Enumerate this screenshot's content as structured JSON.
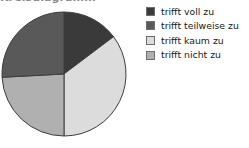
{
  "title": {
    "text": "Kreisdiagramm",
    "clipped": true
  },
  "legend": {
    "position": "right",
    "items": [
      {
        "label": "trifft voll zu",
        "color": "#3a3a3a",
        "swatch_name": "legend-swatch-trifft-voll-zu"
      },
      {
        "label": "trifft teilweise zu",
        "color": "#595959",
        "swatch_name": "legend-swatch-trifft-teilweise-zu"
      },
      {
        "label": "trifft kaum zu",
        "color": "#dcdcdc",
        "swatch_name": "legend-swatch-trifft-kaum-zu"
      },
      {
        "label": "trifft nicht zu",
        "color": "#b0b0b0",
        "swatch_name": "legend-swatch-trifft-nicht-zu"
      }
    ]
  },
  "chart_data": {
    "type": "pie",
    "title": "Kreisdiagramm",
    "xlabel": "",
    "ylabel": "",
    "legend_position": "right",
    "grid": false,
    "start_angle_deg": 0,
    "direction": "clockwise",
    "categories": [
      "trifft voll zu",
      "trifft teilweise zu",
      "trifft kaum zu",
      "trifft nicht zu"
    ],
    "values": [
      15,
      26,
      35,
      24
    ],
    "unit": "%",
    "colors": [
      "#3a3a3a",
      "#595959",
      "#dcdcdc",
      "#b0b0b0"
    ],
    "slices": [
      {
        "label": "trifft voll zu",
        "value": 15,
        "color": "#3a3a3a",
        "start_deg": 0,
        "end_deg": 53
      },
      {
        "label": "trifft kaum zu",
        "value": 35,
        "color": "#dcdcdc",
        "start_deg": 53,
        "end_deg": 180
      },
      {
        "label": "trifft nicht zu",
        "value": 24,
        "color": "#b0b0b0",
        "start_deg": 180,
        "end_deg": 267
      },
      {
        "label": "trifft teilweise zu",
        "value": 26,
        "color": "#595959",
        "start_deg": 267,
        "end_deg": 360
      }
    ],
    "geometry": {
      "cx": 64,
      "cy": 65,
      "r": 62,
      "stroke": "#3d3d3d",
      "stroke_width": 1
    }
  }
}
